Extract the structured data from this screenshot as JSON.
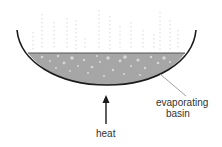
{
  "diagram": {
    "title": "",
    "labels": {
      "basin_line1": "evaporating",
      "basin_line2": "basin",
      "heat": "heat"
    },
    "elements": [
      {
        "id": "basin",
        "type": "bowl",
        "description": "curved evaporating basin"
      },
      {
        "id": "liquid",
        "type": "filled-region",
        "description": "grey liquid with bubbles"
      },
      {
        "id": "vapour",
        "type": "dotted-lines",
        "description": "rising vapour"
      },
      {
        "id": "heat-arrow",
        "type": "arrow",
        "direction": "up"
      }
    ],
    "colors": {
      "outline": "#1a1a1a",
      "liquid": "#a6a6a6",
      "liquid_surface": "#555555",
      "bubbles": "#d4d4d4",
      "vapour": "#c8c8c8",
      "leader_line": "#888888",
      "text": "#333333"
    }
  }
}
